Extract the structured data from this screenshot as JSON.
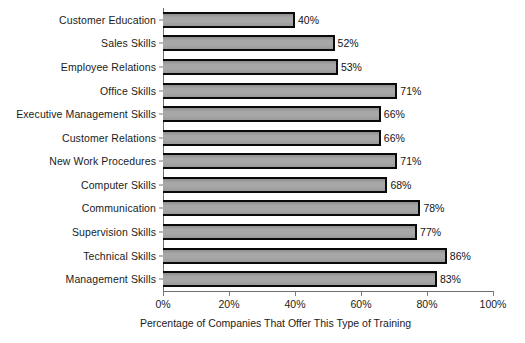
{
  "chart_data": {
    "type": "bar",
    "orientation": "horizontal",
    "title": "",
    "xlabel": "Percentage of Companies That Offer This Type of Training",
    "ylabel": "",
    "xlim": [
      0,
      100
    ],
    "grid": false,
    "legend": null,
    "categories": [
      "Customer Education",
      "Sales Skills",
      "Employee Relations",
      "Office Skills",
      "Executive Management Skills",
      "Customer Relations",
      "New Work Procedures",
      "Computer Skills",
      "Communication",
      "Supervision Skills",
      "Technical Skills",
      "Management Skills"
    ],
    "values": [
      40,
      52,
      53,
      71,
      66,
      66,
      71,
      68,
      78,
      77,
      86,
      83
    ],
    "value_labels": [
      "40%",
      "52%",
      "53%",
      "71%",
      "66%",
      "66%",
      "71%",
      "68%",
      "78%",
      "77%",
      "86%",
      "83%"
    ],
    "xticks": [
      0,
      20,
      40,
      60,
      80,
      100
    ],
    "xtick_labels": [
      "0%",
      "20%",
      "40%",
      "60%",
      "80%",
      "100%"
    ],
    "colors": {
      "bar_fill": "#a0a0a0",
      "bar_edge": "#0a0a0a",
      "axis": "#6e6e6e",
      "text": "#1b1b1b",
      "background": "#ffffff"
    }
  }
}
